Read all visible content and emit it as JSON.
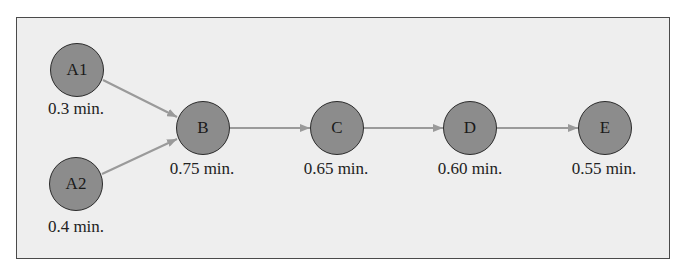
{
  "diagram": {
    "type": "precedence-diagram",
    "colors": {
      "background": "#eeeeee",
      "frame_border": "#4a4a4a",
      "node_fill": "#8c8c8c",
      "node_outline": "#2b2b2b",
      "edge": "#9a9a9a",
      "text": "#222222"
    },
    "nodes": [
      {
        "id": "A1",
        "label": "A1",
        "time": "0.3 min.",
        "cx": 77,
        "cy": 70
      },
      {
        "id": "A2",
        "label": "A2",
        "time": "0.4 min.",
        "cx": 76,
        "cy": 184
      },
      {
        "id": "B",
        "label": "B",
        "time": "0.75 min.",
        "cx": 203,
        "cy": 128
      },
      {
        "id": "C",
        "label": "C",
        "time": "0.65 min.",
        "cx": 337,
        "cy": 128
      },
      {
        "id": "D",
        "label": "D",
        "time": "0.60 min.",
        "cx": 470,
        "cy": 128
      },
      {
        "id": "E",
        "label": "E",
        "time": "0.55 min.",
        "cx": 605,
        "cy": 128
      }
    ],
    "edges": [
      {
        "from": "A1",
        "to": "B"
      },
      {
        "from": "A2",
        "to": "B"
      },
      {
        "from": "B",
        "to": "C"
      },
      {
        "from": "C",
        "to": "D"
      },
      {
        "from": "D",
        "to": "E"
      }
    ]
  }
}
